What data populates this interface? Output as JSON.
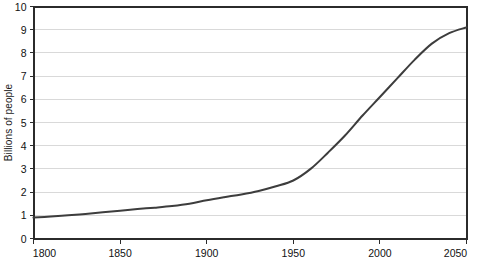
{
  "chart_data": {
    "type": "line",
    "title": "",
    "subtitle": "",
    "xlabel": "",
    "ylabel": "Billions of people",
    "xlim": [
      1800,
      2050
    ],
    "ylim": [
      0,
      10
    ],
    "xticks": [
      1800,
      1850,
      1900,
      1950,
      2000,
      2050
    ],
    "xtick_labels": [
      "1800",
      "1850",
      "1900",
      "1950",
      "2000",
      "2050"
    ],
    "yticks": [
      0,
      1,
      2,
      3,
      4,
      5,
      6,
      7,
      8,
      9,
      10
    ],
    "ytick_labels": [
      "0",
      "1",
      "2",
      "3",
      "4",
      "5",
      "6",
      "7",
      "8",
      "9",
      "10"
    ],
    "grid": {
      "horizontal": true,
      "vertical": false,
      "color": "#d9d9d9"
    },
    "legend": {
      "visible": false,
      "position": "none",
      "entries": []
    },
    "annotations": [],
    "series": [
      {
        "name": "World population",
        "color": "#3d3d3d",
        "line_width": 2,
        "markers": false,
        "x": [
          1800,
          1810,
          1820,
          1830,
          1840,
          1850,
          1860,
          1870,
          1880,
          1890,
          1900,
          1910,
          1920,
          1930,
          1940,
          1950,
          1960,
          1970,
          1980,
          1990,
          2000,
          2010,
          2020,
          2030,
          2040,
          2050
        ],
        "values": [
          0.9,
          0.95,
          1.0,
          1.06,
          1.13,
          1.2,
          1.27,
          1.33,
          1.4,
          1.5,
          1.65,
          1.78,
          1.9,
          2.05,
          2.25,
          2.5,
          3.0,
          3.7,
          4.45,
          5.3,
          6.1,
          6.9,
          7.7,
          8.4,
          8.85,
          9.1
        ]
      }
    ]
  },
  "axes": {
    "frame_color": "#2b2b2b",
    "tick_color": "#2b2b2b",
    "background": "#ffffff"
  }
}
